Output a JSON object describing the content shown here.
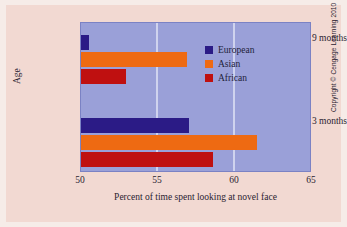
{
  "figure": {
    "background_color": "#f2d9d2",
    "plot_background_color": "#9aa0d8",
    "gridline_color": "#cfd3ee",
    "credit": "Copyright © Cengage Learning 2010"
  },
  "chart_data": {
    "type": "bar",
    "orientation": "horizontal",
    "title": "",
    "xlabel": "Percent of time spent looking at novel face",
    "ylabel": "Age",
    "categories": [
      "9 months",
      "3 months"
    ],
    "series": [
      {
        "name": "European",
        "color": "#2b1b86",
        "values": [
          50.5,
          57.0
        ]
      },
      {
        "name": "Asian",
        "color": "#ee6a12",
        "values": [
          56.9,
          61.4
        ]
      },
      {
        "name": "African",
        "color": "#bf1010",
        "values": [
          52.9,
          58.6
        ]
      }
    ],
    "xlim": [
      50,
      65
    ],
    "xticks": [
      50,
      55,
      60,
      65
    ],
    "xtick_labels": [
      "50",
      "55",
      "60",
      "65"
    ],
    "grid": true,
    "legend_position": "inside-upper-right",
    "legend_entries": [
      "European",
      "Asian",
      "African"
    ]
  }
}
